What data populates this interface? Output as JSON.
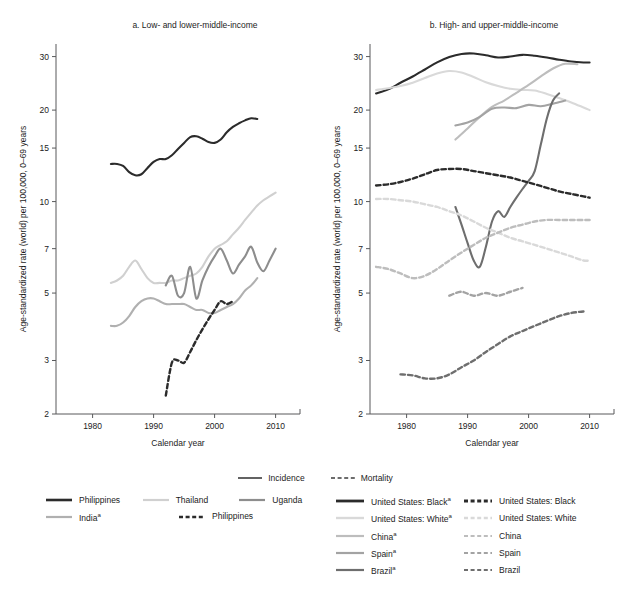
{
  "panels": {
    "a": {
      "title": "a. Low- and lower-middle-income"
    },
    "b": {
      "title": "b. High- and upper-middle-income"
    }
  },
  "axes": {
    "ylabel": "Age-standardized rate (world) per 100,000, 0–69 years",
    "xlabel": "Calendar year",
    "yticks": [
      "2",
      "3",
      "5",
      "7",
      "10",
      "15",
      "20",
      "30"
    ],
    "xticks": [
      "1980",
      "1990",
      "2000",
      "2010"
    ]
  },
  "legend_top": [
    {
      "label": "Incidence",
      "style": "solid",
      "color": "#3c3c3c"
    },
    {
      "label": "Mortality",
      "style": "dashed",
      "color": "#3c3c3c"
    }
  ],
  "legend_left": [
    [
      {
        "label": "Philippines",
        "style": "solid",
        "color": "#2b2b2b",
        "width": 2.6
      },
      {
        "label": "Thailand",
        "style": "solid",
        "color": "#d0d0d0",
        "width": 2.2
      },
      {
        "label": "Uganda",
        "style": "solid",
        "color": "#8d8d8d",
        "width": 2.2
      }
    ],
    [
      {
        "label": "India",
        "sup": "a",
        "style": "solid",
        "color": "#b0b0b0",
        "width": 2.2
      },
      {
        "label": "Philippines",
        "style": "dashed",
        "color": "#2b2b2b",
        "width": 2.6
      }
    ]
  ],
  "legend_right": [
    {
      "solid": {
        "label": "United States: Black",
        "sup": "a",
        "color": "#2b2b2b",
        "width": 2.8
      },
      "dashed": {
        "label": "United States: Black",
        "color": "#2b2b2b",
        "width": 2.8
      }
    },
    {
      "solid": {
        "label": "United States: White",
        "sup": "a",
        "color": "#d9d9d9",
        "width": 2.4
      },
      "dashed": {
        "label": "United States: White",
        "color": "#d9d9d9",
        "width": 2.4
      }
    },
    {
      "solid": {
        "label": "China",
        "sup": "a",
        "color": "#bdbdbd",
        "width": 2.2
      },
      "dashed": {
        "label": "China",
        "color": "#bdbdbd",
        "width": 2.2
      }
    },
    {
      "solid": {
        "label": "Spain",
        "sup": "a",
        "color": "#a3a3a3",
        "width": 2.2
      },
      "dashed": {
        "label": "Spain",
        "color": "#a3a3a3",
        "width": 2.2
      }
    },
    {
      "solid": {
        "label": "Brazil",
        "sup": "a",
        "color": "#6e6e6e",
        "width": 2.2
      },
      "dashed": {
        "label": "Brazil",
        "color": "#6e6e6e",
        "width": 2.2
      }
    }
  ],
  "chart_data": {
    "type": "line",
    "xlabel": "Calendar year",
    "ylabel": "Age-standardized rate (world) per 100,000, 0–69 years",
    "yscale": "log",
    "ylim": [
      2,
      33
    ],
    "yticks": [
      2,
      3,
      5,
      7,
      10,
      15,
      20,
      30
    ],
    "xlim": [
      1974,
      2014
    ],
    "xticks": [
      1980,
      1990,
      2000,
      2010
    ],
    "grid": false,
    "legend_position": "below",
    "panels": [
      {
        "id": "a",
        "title": "a. Low- and lower-middle-income",
        "series": [
          {
            "name": "Philippines",
            "measure": "Incidence",
            "style": "solid",
            "color": "#2b2b2b",
            "x": [
              1983,
              1984,
              1985,
              1986,
              1987,
              1988,
              1989,
              1990,
              1991,
              1992,
              1993,
              1994,
              1995,
              1996,
              1997,
              1998,
              1999,
              2000,
              2001,
              2002,
              2003,
              2004,
              2005,
              2006,
              2007
            ],
            "y": [
              13.3,
              13.3,
              13.1,
              12.5,
              12.2,
              12.3,
              12.9,
              13.5,
              13.8,
              13.8,
              14.2,
              14.9,
              15.6,
              16.3,
              16.4,
              16.1,
              15.7,
              15.6,
              16.0,
              16.9,
              17.6,
              18.1,
              18.5,
              18.8,
              18.7
            ]
          },
          {
            "name": "Thailand",
            "measure": "Incidence",
            "style": "solid",
            "color": "#d0d0d0",
            "x": [
              1983,
              1984,
              1985,
              1986,
              1987,
              1988,
              1989,
              1990,
              1991,
              1992,
              1993,
              1994,
              1995,
              1996,
              1997,
              1998,
              1999,
              2000,
              2001,
              2002,
              2003,
              2004,
              2005,
              2006,
              2007,
              2008,
              2009,
              2010
            ],
            "y": [
              5.4,
              5.5,
              5.7,
              6.1,
              6.4,
              6.0,
              5.6,
              5.4,
              5.4,
              5.4,
              5.5,
              5.5,
              5.6,
              5.7,
              5.8,
              6.1,
              6.6,
              7.0,
              7.2,
              7.4,
              7.8,
              8.2,
              8.7,
              9.2,
              9.7,
              10.1,
              10.4,
              10.7
            ]
          },
          {
            "name": "Uganda",
            "measure": "Incidence",
            "style": "solid",
            "color": "#8d8d8d",
            "x": [
              1992,
              1993,
              1994,
              1995,
              1996,
              1997,
              1998,
              1999,
              2000,
              2001,
              2002,
              2003,
              2004,
              2005,
              2006,
              2007,
              2008,
              2009,
              2010
            ],
            "y": [
              5.3,
              5.7,
              4.9,
              5.0,
              6.1,
              4.8,
              5.5,
              6.1,
              6.6,
              7.0,
              6.4,
              5.8,
              6.2,
              6.6,
              7.1,
              6.3,
              5.9,
              6.4,
              7.0
            ]
          },
          {
            "name": "India",
            "measure": "Incidence",
            "style": "solid",
            "color": "#b0b0b0",
            "x": [
              1983,
              1984,
              1985,
              1986,
              1987,
              1988,
              1989,
              1990,
              1991,
              1992,
              1993,
              1994,
              1995,
              1996,
              1997,
              1998,
              1999,
              2000,
              2001,
              2002,
              2003,
              2004,
              2005,
              2006,
              2007
            ],
            "y": [
              3.9,
              3.9,
              4.0,
              4.2,
              4.5,
              4.7,
              4.8,
              4.8,
              4.7,
              4.6,
              4.6,
              4.6,
              4.6,
              4.5,
              4.4,
              4.4,
              4.3,
              4.3,
              4.4,
              4.5,
              4.6,
              4.8,
              5.1,
              5.3,
              5.6
            ]
          },
          {
            "name": "Philippines",
            "measure": "Mortality",
            "style": "dashed",
            "color": "#2b2b2b",
            "x": [
              1992,
              1993,
              1994,
              1995,
              1996,
              1997,
              1998,
              1999,
              2000,
              2001,
              2002,
              2003
            ],
            "y": [
              2.3,
              2.95,
              3.0,
              2.95,
              3.2,
              3.5,
              3.8,
              4.1,
              4.4,
              4.7,
              4.6,
              4.7
            ]
          }
        ]
      },
      {
        "id": "b",
        "title": "b. High- and upper-middle-income",
        "series": [
          {
            "name": "United States: Black",
            "measure": "Incidence",
            "style": "solid",
            "color": "#2b2b2b",
            "x": [
              1975,
              1977,
              1979,
              1981,
              1983,
              1985,
              1987,
              1989,
              1991,
              1993,
              1995,
              1997,
              1999,
              2001,
              2003,
              2005,
              2007,
              2009,
              2010
            ],
            "y": [
              22.7,
              23.4,
              24.6,
              25.8,
              27.2,
              28.7,
              29.9,
              30.6,
              30.7,
              30.3,
              29.8,
              30.0,
              30.4,
              30.2,
              29.8,
              29.3,
              28.9,
              28.7,
              28.7
            ]
          },
          {
            "name": "United States: White",
            "measure": "Incidence",
            "style": "solid",
            "color": "#d9d9d9",
            "x": [
              1975,
              1977,
              1979,
              1981,
              1983,
              1985,
              1987,
              1989,
              1991,
              1993,
              1995,
              1997,
              1999,
              2001,
              2003,
              2005,
              2007,
              2009,
              2010
            ],
            "y": [
              23.3,
              23.6,
              24.0,
              24.6,
              25.5,
              26.4,
              26.9,
              26.6,
              25.7,
              24.7,
              24.0,
              23.5,
              23.3,
              23.2,
              22.6,
              21.9,
              21.2,
              20.4,
              20.0
            ]
          },
          {
            "name": "China",
            "measure": "Incidence",
            "style": "solid",
            "color": "#bdbdbd",
            "x": [
              1988,
              1990,
              1992,
              1994,
              1996,
              1998,
              2000,
              2002,
              2004,
              2006,
              2008
            ],
            "y": [
              16.0,
              17.4,
              19.0,
              20.5,
              21.5,
              22.8,
              24.2,
              25.8,
              27.4,
              28.4,
              28.3
            ]
          },
          {
            "name": "Spain",
            "measure": "Incidence",
            "style": "solid",
            "color": "#a3a3a3",
            "x": [
              1988,
              1990,
              1992,
              1994,
              1996,
              1998,
              2000,
              2002,
              2004,
              2006
            ],
            "y": [
              17.8,
              18.2,
              19.0,
              20.2,
              20.4,
              20.3,
              20.8,
              20.6,
              21.0,
              21.5
            ]
          },
          {
            "name": "Brazil",
            "measure": "Incidence",
            "style": "solid",
            "color": "#6e6e6e",
            "x": [
              1988,
              1989,
              1990,
              1991,
              1992,
              1993,
              1994,
              1995,
              1996,
              1997,
              1998,
              1999,
              2000,
              2001,
              2002,
              2003,
              2004,
              2005
            ],
            "y": [
              9.6,
              8.4,
              7.3,
              6.4,
              6.1,
              7.1,
              8.6,
              9.3,
              8.9,
              9.6,
              10.3,
              11.0,
              11.7,
              12.6,
              15.4,
              18.8,
              21.5,
              22.7
            ]
          },
          {
            "name": "United States: Black",
            "measure": "Mortality",
            "style": "dashed",
            "color": "#2b2b2b",
            "x": [
              1975,
              1977,
              1979,
              1981,
              1983,
              1985,
              1987,
              1989,
              1991,
              1993,
              1995,
              1997,
              1999,
              2001,
              2003,
              2005,
              2007,
              2009,
              2010
            ],
            "y": [
              11.3,
              11.4,
              11.6,
              11.9,
              12.3,
              12.7,
              12.8,
              12.8,
              12.6,
              12.4,
              12.2,
              12.0,
              11.7,
              11.4,
              11.1,
              10.8,
              10.6,
              10.4,
              10.3
            ]
          },
          {
            "name": "United States: White",
            "measure": "Mortality",
            "style": "dashed",
            "color": "#d9d9d9",
            "x": [
              1975,
              1977,
              1979,
              1981,
              1983,
              1985,
              1987,
              1989,
              1991,
              1993,
              1995,
              1997,
              1999,
              2001,
              2003,
              2005,
              2007,
              2009,
              2010
            ],
            "y": [
              10.2,
              10.2,
              10.1,
              10.0,
              9.8,
              9.6,
              9.3,
              9.0,
              8.6,
              8.2,
              7.9,
              7.6,
              7.4,
              7.2,
              7.0,
              6.8,
              6.6,
              6.4,
              6.4
            ]
          },
          {
            "name": "China",
            "measure": "Mortality",
            "style": "dashed",
            "color": "#bdbdbd",
            "x": [
              1975,
              1977,
              1979,
              1981,
              1983,
              1985,
              1987,
              1989,
              1991,
              1993,
              1995,
              1997,
              1999,
              2001,
              2003,
              2005,
              2007,
              2009,
              2010
            ],
            "y": [
              6.1,
              6.0,
              5.8,
              5.6,
              5.7,
              6.0,
              6.4,
              6.8,
              7.2,
              7.6,
              7.9,
              8.2,
              8.4,
              8.6,
              8.7,
              8.7,
              8.7,
              8.7,
              8.7
            ]
          },
          {
            "name": "Spain",
            "measure": "Mortality",
            "style": "dashed",
            "color": "#a3a3a3",
            "x": [
              1987,
              1989,
              1991,
              1993,
              1995,
              1997,
              1999
            ],
            "y": [
              4.9,
              5.05,
              4.9,
              5.0,
              4.9,
              5.05,
              5.2
            ]
          },
          {
            "name": "Brazil",
            "measure": "Mortality",
            "style": "dashed",
            "color": "#6e6e6e",
            "x": [
              1979,
              1981,
              1983,
              1985,
              1987,
              1989,
              1991,
              1993,
              1995,
              1997,
              1999,
              2001,
              2003,
              2005,
              2007,
              2009
            ],
            "y": [
              2.7,
              2.68,
              2.62,
              2.62,
              2.7,
              2.85,
              3.0,
              3.2,
              3.4,
              3.6,
              3.75,
              3.9,
              4.05,
              4.2,
              4.3,
              4.35
            ]
          }
        ]
      }
    ]
  }
}
